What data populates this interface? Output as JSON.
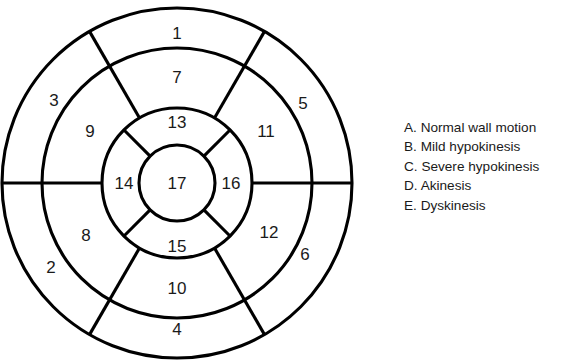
{
  "diagram": {
    "name": "AHA 17-segment left ventricular bullseye diagram",
    "center": {
      "x": 177,
      "y": 183
    },
    "radii": {
      "outer": 175,
      "mid_outer": 135,
      "mid_inner": 75,
      "apex": 38
    },
    "stroke_color": "#000000",
    "fill_color": "#ffffff",
    "background": "#ffffff",
    "rings": [
      {
        "name": "basal",
        "segment_count": 6,
        "sector_degrees": 60,
        "boundary_angles_deg": [
          0,
          60,
          120,
          180,
          240,
          300
        ],
        "segments": [
          {
            "number": "1",
            "label_x": 177,
            "label_y": 331
          },
          {
            "number": "2",
            "label_x": 51,
            "label_y": 269
          },
          {
            "number": "3",
            "label_x": 54,
            "label_y": 102
          },
          {
            "number": "4",
            "label_x": 177,
            "label_y": 35
          },
          {
            "number": "5",
            "label_x": 303,
            "label_y": 105
          },
          {
            "number": "6",
            "label_x": 305,
            "label_y": 256
          }
        ]
      },
      {
        "name": "mid",
        "segment_count": 6,
        "sector_degrees": 60,
        "boundary_angles_deg": [
          0,
          60,
          120,
          180,
          240,
          300
        ],
        "segments": [
          {
            "number": "7",
            "label_x": 177,
            "label_y": 290
          },
          {
            "number": "8",
            "label_x": 86,
            "label_y": 237
          },
          {
            "number": "9",
            "label_x": 90,
            "label_y": 133
          },
          {
            "number": "10",
            "label_x": 177,
            "label_y": 79
          },
          {
            "number": "11",
            "label_x": 266,
            "label_y": 133
          },
          {
            "number": "12",
            "label_x": 269,
            "label_y": 234
          }
        ]
      },
      {
        "name": "apical",
        "segment_count": 4,
        "sector_degrees": 90,
        "boundary_angles_deg": [
          45,
          135,
          225,
          315
        ],
        "segments": [
          {
            "number": "13",
            "label_x": 177,
            "label_y": 248
          },
          {
            "number": "14",
            "label_x": 124,
            "label_y": 185
          },
          {
            "number": "15",
            "label_x": 177,
            "label_y": 124
          },
          {
            "number": "16",
            "label_x": 231,
            "label_y": 185
          }
        ]
      },
      {
        "name": "apex",
        "segment_count": 1,
        "sector_degrees": 360,
        "boundary_angles_deg": [],
        "segments": [
          {
            "number": "17",
            "label_x": 177,
            "label_y": 185
          }
        ]
      }
    ]
  },
  "legend": {
    "items": [
      {
        "key": "A.",
        "text": "Normal wall motion"
      },
      {
        "key": "B.",
        "text": "Mild hypokinesis"
      },
      {
        "key": "C.",
        "text": "Severe hypokinesis"
      },
      {
        "key": "D.",
        "text": "Akinesis"
      },
      {
        "key": "E.",
        "text": "Dyskinesis"
      }
    ]
  }
}
